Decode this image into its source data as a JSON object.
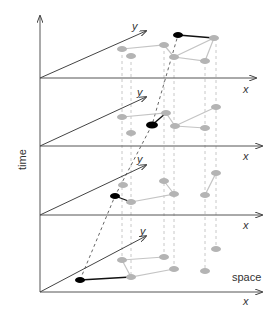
{
  "diagram": {
    "title": "",
    "time_axis_label": "time",
    "space_label": "space",
    "x_axis_label": "x",
    "y_axis_label": "y",
    "colors": {
      "axis": "#555555",
      "node": "#b4b4b4",
      "tracked_node": "#000000",
      "edge": "#c4c4c4",
      "dashed_projection": "#c8c8c8",
      "trajectory": "#666666"
    },
    "layers": [
      {
        "name": "t4",
        "plane_y": 78
      },
      {
        "name": "t3",
        "plane_y": 146
      },
      {
        "name": "t2",
        "plane_y": 215
      },
      {
        "name": "t1",
        "plane_y": 292
      }
    ]
  }
}
